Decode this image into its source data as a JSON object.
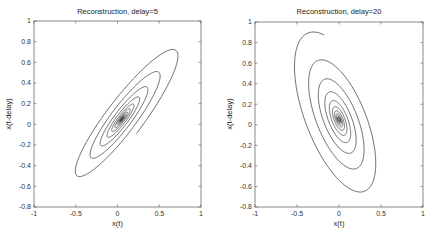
{
  "chart_data": [
    {
      "type": "line",
      "title": "Reconstruction, delay=5",
      "xlabel": "x(t)",
      "ylabel": "x(t-delay)",
      "xlim": [
        -1,
        1
      ],
      "ylim": [
        -0.8,
        1
      ],
      "xticks": [
        "-1",
        "-0.5",
        "0",
        "0.5",
        "1"
      ],
      "yticks": [
        "-0.8",
        "-0.6",
        "-0.4",
        "-0.2",
        "0",
        "0.2",
        "0.4",
        "0.6",
        "0.8",
        "1"
      ],
      "grid": false,
      "delay": 5,
      "series": [
        {
          "name": "trajectory",
          "description": "inward spiral to origin, elongated along positive diagonal",
          "x": [
            0.4,
            0.9,
            0.0,
            -0.75,
            0.0,
            0.6,
            0.0,
            -0.5,
            0.0,
            0.0
          ],
          "y": [
            0.05,
            0.92,
            0.3,
            -0.78,
            -0.1,
            0.6,
            0.1,
            -0.55,
            0.0,
            0.0
          ]
        }
      ]
    },
    {
      "type": "line",
      "title": "Reconstruction, delay=20",
      "xlabel": "x(t)",
      "ylabel": "x(t-delay)",
      "xlim": [
        -1,
        1
      ],
      "ylim": [
        -0.8,
        1
      ],
      "xticks": [
        "-1",
        "-0.5",
        "0",
        "0.5",
        "1"
      ],
      "yticks": [
        "-0.8",
        "-0.6",
        "-0.4",
        "-0.2",
        "0",
        "0.2",
        "0.4",
        "0.6",
        "0.8",
        "1"
      ],
      "grid": false,
      "delay": 20,
      "series": [
        {
          "name": "trajectory",
          "description": "inward spiral to origin, elongated along negative diagonal",
          "x": [
            -0.6,
            -0.55,
            0.2,
            0.65,
            0.45,
            -0.4,
            0.0,
            0.0
          ],
          "y": [
            0.0,
            0.92,
            0.7,
            -0.4,
            -0.78,
            0.6,
            0.0,
            0.0
          ]
        }
      ]
    }
  ],
  "plots": [
    {
      "title": "Reconstruction, delay=5",
      "xlabel": "x(t)",
      "ylabel": "x(t-delay)"
    },
    {
      "title": "Reconstruction, delay=20",
      "xlabel": "x(t)",
      "ylabel": "x(t-delay)"
    }
  ],
  "style": {
    "line_color": "#333333",
    "axis_color": "#555555"
  }
}
